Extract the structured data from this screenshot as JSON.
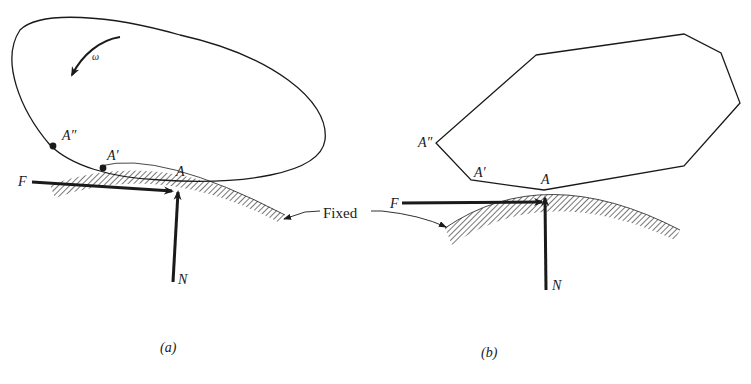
{
  "figure": {
    "panel_a": {
      "caption": "(a)",
      "body_shape": "ellipse",
      "rotation_label": "ω",
      "points": [
        {
          "label": "A″"
        },
        {
          "label": "A′"
        },
        {
          "label": "A"
        }
      ],
      "force_labels": {
        "friction": "F",
        "normal": "N"
      }
    },
    "panel_b": {
      "caption": "(b)",
      "body_shape": "polygon",
      "points": [
        {
          "label": "A″"
        },
        {
          "label": "A′"
        },
        {
          "label": "A"
        }
      ],
      "force_labels": {
        "friction": "F",
        "normal": "N"
      }
    },
    "shared": {
      "fixed_label": "Fixed"
    },
    "colors": {
      "ink": "#1a1a1a",
      "background": "#ffffff"
    }
  }
}
